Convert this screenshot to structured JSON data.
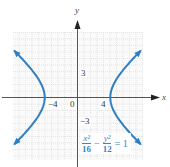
{
  "chart_data": {
    "type": "line",
    "title": "",
    "equation": {
      "x_numerator": "x²",
      "x_denominator": "16",
      "minus": "−",
      "y_numerator": "y²",
      "y_denominator": "12",
      "rhs": "= 1"
    },
    "xlabel": "x",
    "ylabel": "y",
    "x_tick_labels": [
      "−4",
      "0",
      "4"
    ],
    "y_tick_labels": [
      "3",
      "−3"
    ],
    "xlim": [
      -8,
      8
    ],
    "ylim": [
      -7.5,
      7.5
    ],
    "grid": true,
    "series": [
      {
        "name": "hyperbola right branch",
        "a": 4,
        "b_squared": 12,
        "vertex": [
          4,
          0
        ],
        "color": "#2f7fc1"
      },
      {
        "name": "hyperbola left branch",
        "a": 4,
        "b_squared": 12,
        "vertex": [
          -4,
          0
        ],
        "color": "#2f7fc1"
      }
    ],
    "colors": {
      "curve": "#2f7fc1",
      "equation": "#3a86c8",
      "grid": "#d6d6d6",
      "axis": "#555555"
    }
  },
  "labels": {
    "x_axis": "x",
    "y_axis": "y",
    "tick_neg4": "−4",
    "tick_0": "0",
    "tick_4": "4",
    "tick_3": "3",
    "tick_neg3": "−3"
  }
}
